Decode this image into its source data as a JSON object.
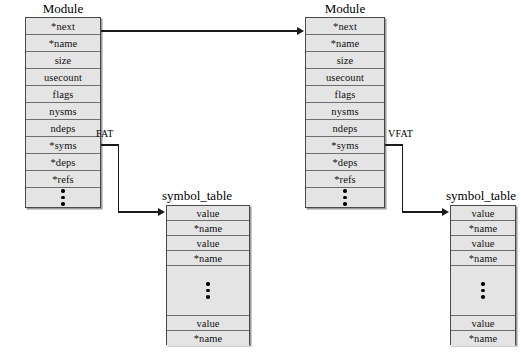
{
  "diagram": {
    "background_color": "#ffffff",
    "box_fill_color": "#e4e4e4",
    "box_border_color": "#4a4a4a",
    "line_color": "#1a1a1a"
  },
  "modules": [
    {
      "id": "module-left",
      "title": "Module",
      "fields": [
        "*next",
        "*name",
        "size",
        "usecount",
        "flags",
        "nysms",
        "ndeps",
        "*syms",
        "*deps",
        "*refs"
      ],
      "ellipsis": "• • •"
    },
    {
      "id": "module-right",
      "title": "Module",
      "fields": [
        "*next",
        "*name",
        "size",
        "usecount",
        "flags",
        "nysms",
        "ndeps",
        "*syms",
        "*deps",
        "*refs"
      ],
      "ellipsis": "• • •"
    }
  ],
  "symbol_tables": [
    {
      "id": "symbol-table-left",
      "title": "symbol_table",
      "top_fields": [
        "value",
        "*name",
        "value",
        "*name"
      ],
      "ellipsis": "• • •",
      "bottom_fields": [
        "value",
        "*name"
      ]
    },
    {
      "id": "symbol-table-right",
      "title": "symbol_table",
      "top_fields": [
        "value",
        "*name",
        "value",
        "*name"
      ],
      "ellipsis": "• • •",
      "bottom_fields": [
        "value",
        "*name"
      ]
    }
  ],
  "edges": [
    {
      "id": "edge-next",
      "label": "",
      "from": "module-left.*next",
      "to": "module-right"
    },
    {
      "id": "edge-fat",
      "label": "FAT",
      "from": "module-left.*syms",
      "to": "symbol-table-left"
    },
    {
      "id": "edge-vfat",
      "label": "VFAT",
      "from": "module-right.*syms",
      "to": "symbol-table-right"
    }
  ]
}
